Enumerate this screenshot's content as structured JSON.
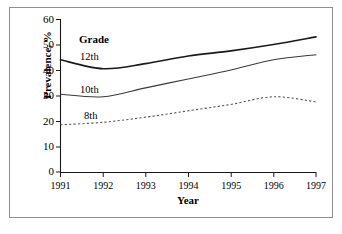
{
  "chart_data": {
    "type": "line",
    "title": "",
    "xlabel": "Year",
    "ylabel": "Prevalence, %",
    "legend_title": "Grade",
    "legend_position": "inline-labels",
    "grid": false,
    "x": [
      1991,
      1992,
      1993,
      1994,
      1995,
      1996,
      1997
    ],
    "xlim": [
      1991,
      1997
    ],
    "ylim": [
      0,
      60
    ],
    "yticks": [
      0,
      10,
      20,
      30,
      40,
      50,
      60
    ],
    "xticks": [
      "1991",
      "1992",
      "1993",
      "1994",
      "1995",
      "1996",
      "1997"
    ],
    "ytick_labels": [
      "60",
      "50",
      "40",
      "30",
      "20",
      "10",
      "0"
    ],
    "series": [
      {
        "name": "12th",
        "label": "12th",
        "style": "solid",
        "color": "#1a1a1a",
        "width": 1.6,
        "values": [
          44.0,
          40.5,
          42.5,
          45.5,
          47.5,
          50.0,
          53.0
        ]
      },
      {
        "name": "10th",
        "label": "10th",
        "style": "solid",
        "color": "#3a3a3a",
        "width": 1.1,
        "values": [
          30.5,
          29.5,
          33.0,
          36.5,
          40.0,
          44.0,
          46.0
        ]
      },
      {
        "name": "8th",
        "label": "8th",
        "style": "dotted",
        "color": "#555555",
        "width": 1.1,
        "values": [
          18.5,
          19.5,
          21.5,
          24.0,
          26.5,
          29.5,
          27.5
        ]
      }
    ],
    "annotations": [
      {
        "text": "Grade",
        "bold": true
      },
      {
        "text": "12th",
        "bold": false
      },
      {
        "text": "10th",
        "bold": false
      },
      {
        "text": "8th",
        "bold": false
      }
    ]
  },
  "axes": {
    "y_label": "Prevalence, %",
    "x_label": "Year",
    "y_ticks": [
      "60",
      "50",
      "40",
      "30",
      "20",
      "10",
      "0"
    ],
    "x_ticks": [
      "1991",
      "1992",
      "1993",
      "1994",
      "1995",
      "1996",
      "1997"
    ]
  },
  "legend": {
    "title": "Grade",
    "items": [
      "12th",
      "10th",
      "8th"
    ]
  },
  "colors": {
    "frame": "#8d8d8d",
    "axis": "#1a1a1a",
    "series_12th": "#1a1a1a",
    "series_10th": "#3a3a3a",
    "series_8th": "#555555",
    "background": "#ffffff"
  }
}
